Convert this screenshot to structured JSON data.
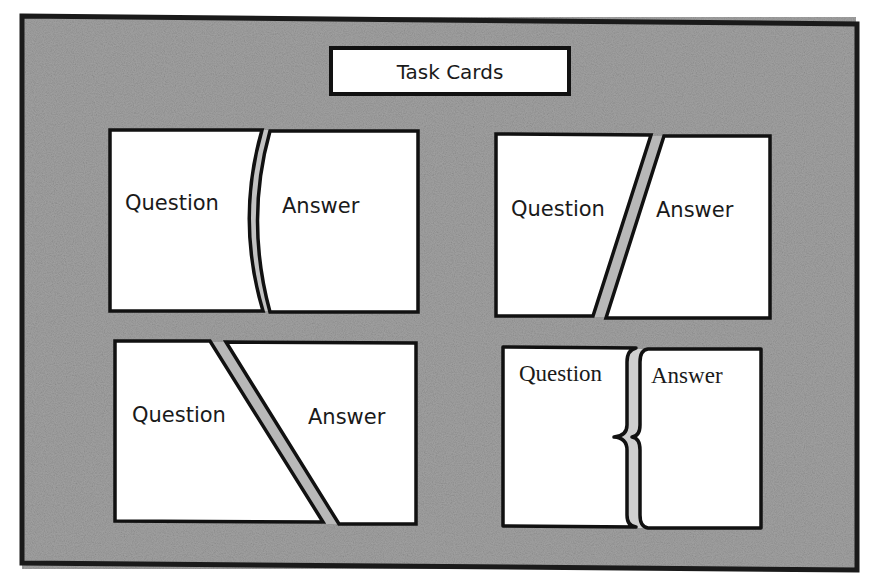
{
  "title": "Task Cards",
  "colors": {
    "board_fill": "#9a9a9a",
    "board_border": "#1a1a1a",
    "card_fill": "#ffffff",
    "card_border": "#111111",
    "gap_fill": "#b4b4b4",
    "page_background": "#ffffff"
  },
  "cards": [
    {
      "id": "curved-cut",
      "cut_style": "curved",
      "question_label": "Question",
      "answer_label": "Answer"
    },
    {
      "id": "forward-slash-cut",
      "cut_style": "diagonal-forward",
      "question_label": "Question",
      "answer_label": "Answer"
    },
    {
      "id": "backslash-cut",
      "cut_style": "diagonal-back",
      "question_label": "Question",
      "answer_label": "Answer"
    },
    {
      "id": "brace-cut",
      "cut_style": "curly-brace",
      "question_label": "Question",
      "answer_label": "Answer"
    }
  ]
}
